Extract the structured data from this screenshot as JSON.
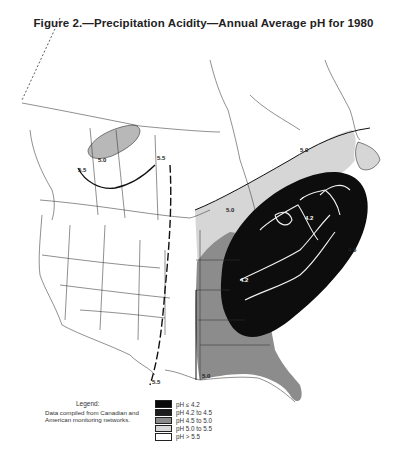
{
  "figure": {
    "title": "Figure 2.—Precipitation Acidity—Annual Average pH for 1980"
  },
  "legend": {
    "title": "Legend:",
    "note": "Data compiled from Canadian and American monitoring networks.",
    "items": [
      {
        "label": "pH ≤ 4.2",
        "color": "#0a0a0a"
      },
      {
        "label": "pH 4.2 to 4.5",
        "color": "#1c1c1c"
      },
      {
        "label": "pH 4.5 to 5.0",
        "color": "#8a8a8a"
      },
      {
        "label": "pH 5.0 to 5.5",
        "color": "#d9d9d9"
      },
      {
        "label": "pH > 5.5",
        "color": "#ffffff"
      }
    ]
  },
  "isolines": {
    "canada_west_50": "5.0",
    "canada_west_55": "5.5",
    "manitoba_55": "5.5",
    "great_lakes_50": "5.0",
    "eastern_45": "4.5",
    "ohio_42": "4.2",
    "northeast_42": "4.2",
    "quebec_50": "5.0",
    "southwest_55": "5.5",
    "gulf_50": "5.0"
  },
  "colors": {
    "band_55": "#d6d6d6",
    "band_50": "#8c8c8c",
    "band_45": "#0d0d0d",
    "boundary": "#222222",
    "river": "#f2f2f2"
  }
}
